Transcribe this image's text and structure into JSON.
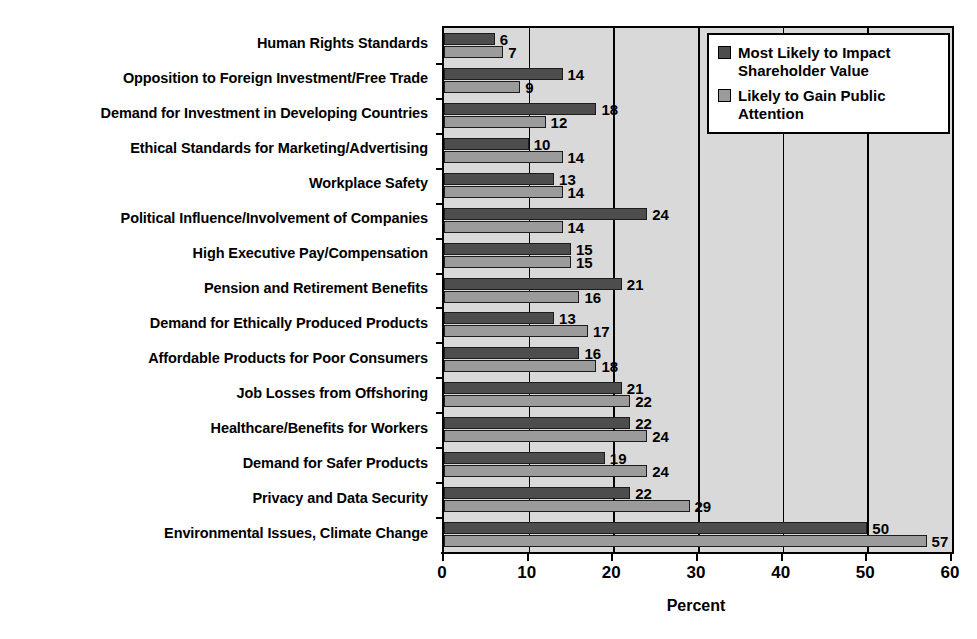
{
  "chart_data": {
    "type": "bar",
    "orientation": "horizontal",
    "title": "",
    "xlabel": "Percent",
    "ylabel": "",
    "xlim": [
      0,
      60
    ],
    "xticks": [
      0,
      10,
      20,
      30,
      40,
      50,
      60
    ],
    "grid": true,
    "legend_position": "upper-right",
    "categories": [
      "Human Rights Standards",
      "Opposition to Foreign Investment/Free Trade",
      "Demand for Investment in Developing Countries",
      "Ethical Standards for Marketing/Advertising",
      "Workplace Safety",
      "Political Influence/Involvement of Companies",
      "High Executive Pay/Compensation",
      "Pension and Retirement Benefits",
      "Demand for Ethically Produced Products",
      "Affordable Products for Poor Consumers",
      "Job Losses from Offshoring",
      "Healthcare/Benefits for Workers",
      "Demand for Safer Products",
      "Privacy and Data Security",
      "Environmental Issues, Climate Change"
    ],
    "series": [
      {
        "name": "Most Likely to Impact Shareholder Value",
        "color": "#4d4d4d",
        "values": [
          6,
          14,
          18,
          10,
          13,
          24,
          15,
          21,
          13,
          16,
          21,
          22,
          19,
          22,
          50
        ]
      },
      {
        "name": "Likely to Gain Public Attention",
        "color": "#9b9b9b",
        "values": [
          7,
          9,
          12,
          14,
          14,
          14,
          15,
          16,
          17,
          18,
          22,
          24,
          24,
          29,
          57
        ]
      }
    ]
  },
  "legend": {
    "entries": [
      {
        "label": "Most Likely to Impact Shareholder Value",
        "swatch": "dark-swatch"
      },
      {
        "label": "Likely to Gain Public Attention",
        "swatch": "light-swatch"
      }
    ]
  },
  "axis": {
    "x_title": "Percent"
  },
  "colors": {
    "series_dark": "#4d4d4d",
    "series_light": "#9b9b9b",
    "plot_background": "#d9d9d9",
    "frame": "#000000"
  }
}
